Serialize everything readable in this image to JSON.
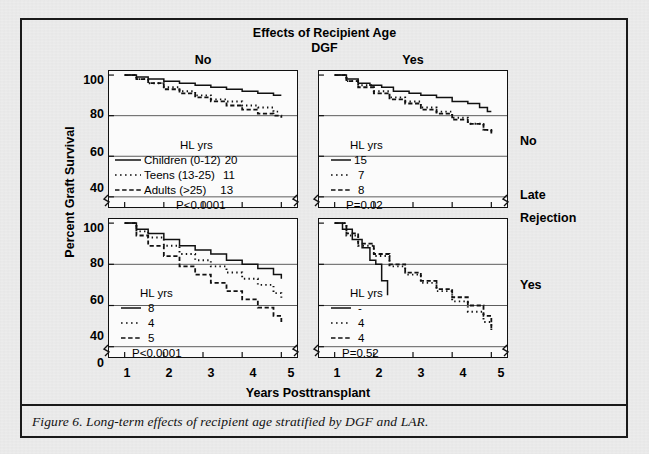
{
  "figure": {
    "caption": "Figure 6.  Long-term effects of recipient age stratified by DGF and LAR.",
    "main_title": "Effects of Recipient Age",
    "group_label": "DGF",
    "column_headers": {
      "left": "No",
      "right": "Yes"
    },
    "row_labels": {
      "top": "No",
      "mid_line1": "Late",
      "mid_line2": "Rejection",
      "bottom": "Yes"
    },
    "y_axis_title": "Percent Graft Survival",
    "x_axis_title": "Years Posttransplant",
    "hl_header": "HL yrs"
  },
  "chart_data": {
    "type": "line",
    "title": "Effects of Recipient Age",
    "xlabel": "Years Posttransplant",
    "ylabel": "Percent Graft Survival",
    "xlim": [
      0.6,
      5.4
    ],
    "ylim": [
      35,
      102
    ],
    "xticks": [
      1,
      2,
      3,
      4,
      5
    ],
    "yticks": [
      100,
      80,
      60,
      40,
      0
    ],
    "y_axis_break": true,
    "grid": "horizontal-at-80-60-40",
    "legend_position": "inside-lower-left",
    "panels": [
      {
        "id": "no-dgf-no-lar",
        "row": "No",
        "column": "No",
        "dgf": "No",
        "late_rejection": "No",
        "p_value": "P<0.0001",
        "hl_header": "HL yrs",
        "series": [
          {
            "name": "Children (0-12)",
            "style": "solid",
            "hl_yrs": "20",
            "x": [
              1.0,
              1.3,
              1.6,
              2.0,
              2.4,
              2.8,
              3.2,
              3.6,
              4.0,
              4.4,
              4.8,
              5.0
            ],
            "values": [
              100,
              99,
              98,
              97,
              96,
              95,
              94,
              93,
              92,
              91,
              90,
              90
            ]
          },
          {
            "name": "Teens (13-25)",
            "style": "dotted",
            "hl_yrs": "11",
            "x": [
              1.0,
              1.3,
              1.6,
              2.0,
              2.4,
              2.8,
              3.2,
              3.6,
              4.0,
              4.4,
              4.8,
              5.0
            ],
            "values": [
              100,
              98,
              96,
              94,
              92,
              90,
              88,
              87,
              85,
              84,
              82,
              82
            ]
          },
          {
            "name": "Adults (>25)",
            "style": "dashed",
            "hl_yrs": "13",
            "x": [
              1.0,
              1.3,
              1.6,
              2.0,
              2.4,
              2.8,
              3.2,
              3.6,
              4.0,
              4.4,
              4.8,
              5.0
            ],
            "values": [
              100,
              98,
              96,
              93,
              91,
              89,
              87,
              85,
              83,
              81,
              80,
              79
            ]
          }
        ]
      },
      {
        "id": "dgf-yes-no-lar",
        "row": "No",
        "column": "Yes",
        "dgf": "Yes",
        "late_rejection": "No",
        "p_value": "P=0.02",
        "hl_header": "HL yrs",
        "series": [
          {
            "name": "Children (0-12)",
            "style": "solid",
            "hl_yrs": "15",
            "x": [
              1.0,
              1.3,
              1.6,
              1.9,
              2.2,
              2.5,
              2.9,
              3.2,
              3.6,
              4.0,
              4.4,
              4.7,
              4.9,
              5.0
            ],
            "values": [
              100,
              98,
              96,
              95,
              94,
              92,
              91,
              90,
              89,
              87,
              86,
              84,
              82,
              82
            ]
          },
          {
            "name": "Teens (13-25)",
            "style": "dotted",
            "hl_yrs": "7",
            "x": [
              1.0,
              1.3,
              1.6,
              2.0,
              2.4,
              2.8,
              3.2,
              3.6,
              4.0,
              4.4,
              4.8,
              5.0
            ],
            "values": [
              100,
              97,
              95,
              92,
              89,
              87,
              84,
              82,
              79,
              76,
              73,
              71
            ]
          },
          {
            "name": "Adults (>25)",
            "style": "dashed",
            "hl_yrs": "8",
            "x": [
              1.0,
              1.3,
              1.6,
              2.0,
              2.4,
              2.8,
              3.2,
              3.6,
              4.0,
              4.4,
              4.8,
              5.0
            ],
            "values": [
              100,
              97,
              94,
              91,
              88,
              86,
              83,
              81,
              78,
              76,
              73,
              70
            ]
          }
        ]
      },
      {
        "id": "no-dgf-yes-lar",
        "row": "Yes",
        "column": "No",
        "dgf": "No",
        "late_rejection": "Yes",
        "p_value": "P<0.0001",
        "hl_header": "HL yrs",
        "series": [
          {
            "name": "Children (0-12)",
            "style": "solid",
            "hl_yrs": "8",
            "x": [
              1.0,
              1.3,
              1.6,
              2.0,
              2.4,
              2.8,
              3.2,
              3.6,
              4.0,
              4.4,
              4.8,
              5.0
            ],
            "values": [
              100,
              97,
              95,
              92,
              89,
              87,
              85,
              82,
              80,
              78,
              75,
              73
            ]
          },
          {
            "name": "Teens (13-25)",
            "style": "dotted",
            "hl_yrs": "4",
            "x": [
              1.0,
              1.3,
              1.6,
              2.0,
              2.4,
              2.8,
              3.2,
              3.6,
              4.0,
              4.4,
              4.8,
              5.0
            ],
            "values": [
              100,
              96,
              93,
              89,
              85,
              82,
              79,
              76,
              73,
              70,
              66,
              63
            ]
          },
          {
            "name": "Adults (>25)",
            "style": "dashed",
            "hl_yrs": "5",
            "x": [
              1.0,
              1.3,
              1.6,
              2.0,
              2.4,
              2.8,
              3.2,
              3.6,
              4.0,
              4.4,
              4.8,
              5.0
            ],
            "values": [
              100,
              94,
              89,
              84,
              79,
              75,
              71,
              67,
              63,
              59,
              55,
              52
            ]
          }
        ]
      },
      {
        "id": "dgf-yes-yes-lar",
        "row": "Yes",
        "column": "Yes",
        "dgf": "Yes",
        "late_rejection": "Yes",
        "p_value": "P=0.52",
        "hl_header": "HL yrs",
        "series": [
          {
            "name": "Children (0-12)",
            "style": "solid",
            "hl_yrs": "-",
            "x": [
              1.0,
              1.2,
              1.45,
              1.7,
              1.9,
              2.05,
              2.2,
              2.35
            ],
            "values": [
              100,
              97,
              92,
              88,
              82,
              80,
              72,
              65
            ]
          },
          {
            "name": "Teens (13-25)",
            "style": "dotted",
            "hl_yrs": "4",
            "x": [
              1.0,
              1.3,
              1.6,
              2.0,
              2.4,
              2.8,
              3.2,
              3.6,
              4.0,
              4.4,
              4.8,
              5.0
            ],
            "values": [
              100,
              94,
              89,
              84,
              79,
              75,
              71,
              67,
              62,
              57,
              52,
              48
            ]
          },
          {
            "name": "Adults (>25)",
            "style": "dashed",
            "hl_yrs": "4",
            "x": [
              1.0,
              1.3,
              1.6,
              2.0,
              2.4,
              2.8,
              3.2,
              3.6,
              4.0,
              4.4,
              4.8,
              5.0
            ],
            "values": [
              100,
              95,
              90,
              85,
              80,
              76,
              72,
              68,
              64,
              60,
              55,
              49
            ]
          }
        ]
      }
    ]
  },
  "axes": {
    "y_ticks_top": [
      "100",
      "80",
      "60",
      "40"
    ],
    "y_ticks_bottom": [
      "100",
      "80",
      "60",
      "40",
      "0"
    ],
    "x_ticks": [
      "1",
      "2",
      "3",
      "4",
      "5"
    ]
  },
  "legends": {
    "top_left": {
      "hl_header": "HL yrs",
      "rows": [
        {
          "style": "solid",
          "label": "Children (0-12)",
          "hl": "20"
        },
        {
          "style": "dotted",
          "label": "Teens (13-25)",
          "hl": "11"
        },
        {
          "style": "dashed",
          "label": "Adults (>25)",
          "hl": "13"
        }
      ],
      "p_value": "P<0.0001"
    },
    "top_right": {
      "hl_header": "HL yrs",
      "rows": [
        {
          "style": "solid",
          "label": "",
          "hl": "15"
        },
        {
          "style": "dotted",
          "label": "",
          "hl": "7"
        },
        {
          "style": "dashed",
          "label": "",
          "hl": "8"
        }
      ],
      "p_value": "P=0.02"
    },
    "bottom_left": {
      "hl_header": "HL yrs",
      "rows": [
        {
          "style": "solid",
          "label": "",
          "hl": "8"
        },
        {
          "style": "dotted",
          "label": "",
          "hl": "4"
        },
        {
          "style": "dashed",
          "label": "",
          "hl": "5"
        }
      ],
      "p_value": "P<0.0001"
    },
    "bottom_right": {
      "hl_header": "HL yrs",
      "rows": [
        {
          "style": "solid",
          "label": "",
          "hl": "-"
        },
        {
          "style": "dotted",
          "label": "",
          "hl": "4"
        },
        {
          "style": "dashed",
          "label": "",
          "hl": "4"
        }
      ],
      "p_value": "P=0.52"
    }
  },
  "colors": {
    "ink": "#111111",
    "paper": "#ececec",
    "panel": "#fbfbfb"
  }
}
